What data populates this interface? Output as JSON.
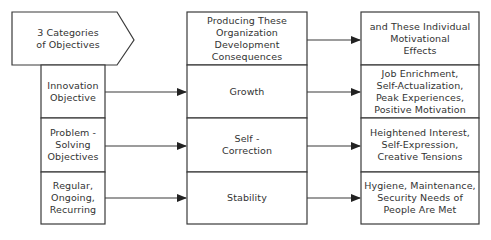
{
  "diagram": {
    "header": {
      "categories": "3 Categories\nof Objectives",
      "consequences": "Producing These\nOrganization\nDevelopment\nConsequences",
      "effects": "and These Individual\nMotivational\nEffects"
    },
    "rows": [
      {
        "objective": "Innovation\nObjective",
        "consequence": "Growth",
        "effect": "Job Enrichment,\nSelf-Actualization,\nPeak Experiences,\nPositive Motivation"
      },
      {
        "objective": "Problem -\nSolving\nObjectives",
        "consequence": "Self -\nCorrection",
        "effect": "Heightened Interest,\nSelf-Expression,\nCreative Tensions"
      },
      {
        "objective": "Regular,\nOngoing,\nRecurring",
        "consequence": "Stability",
        "effect": "Hygiene, Maintenance,\nSecurity Needs of\nPeople Are Met"
      }
    ],
    "colors": {
      "stroke": "#3a3a3a",
      "text": "#333333",
      "background": "#ffffff"
    }
  }
}
